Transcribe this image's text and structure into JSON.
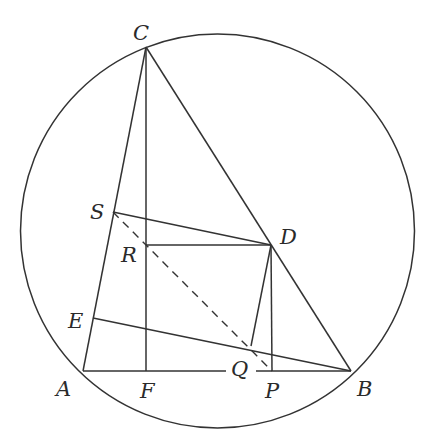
{
  "diagram": {
    "type": "geometry",
    "colors": {
      "stroke": "#333333",
      "label": "#2a2a2a",
      "background": "#ffffff"
    },
    "circle": {
      "cx": 217.5,
      "cy": 231,
      "r": 197
    },
    "points": {
      "A": {
        "label": "A",
        "x": 83,
        "y": 371
      },
      "B": {
        "label": "B",
        "x": 351,
        "y": 371
      },
      "C": {
        "label": "C",
        "x": 146,
        "y": 47
      },
      "D": {
        "label": "D",
        "x": 271,
        "y": 245
      },
      "E": {
        "label": "E",
        "x": 93,
        "y": 318
      },
      "F": {
        "label": "F",
        "x": 146,
        "y": 371
      },
      "P": {
        "label": "P",
        "x": 272,
        "y": 371
      },
      "Q": {
        "label": "Q",
        "x": 251,
        "y": 346
      },
      "R": {
        "label": "R",
        "x": 146,
        "y": 245
      },
      "S": {
        "label": "S",
        "x": 113,
        "y": 212
      }
    },
    "segments": [
      {
        "from": "A",
        "to": "B",
        "style": "solid"
      },
      {
        "from": "A",
        "to": "C",
        "style": "solid"
      },
      {
        "from": "B",
        "to": "C",
        "style": "solid"
      },
      {
        "from": "C",
        "to": "F",
        "style": "solid"
      },
      {
        "from": "S",
        "to": "D",
        "style": "solid"
      },
      {
        "from": "R",
        "to": "D",
        "style": "solid"
      },
      {
        "from": "D",
        "to": "P",
        "style": "solid"
      },
      {
        "from": "D",
        "to": "Q",
        "style": "solid"
      },
      {
        "from": "E",
        "to": "B",
        "style": "solid"
      },
      {
        "from": "S",
        "to": "P",
        "style": "dashed"
      }
    ],
    "labels": [
      {
        "text": "C",
        "x": 133,
        "y": 40
      },
      {
        "text": "S",
        "x": 90,
        "y": 219
      },
      {
        "text": "D",
        "x": 280,
        "y": 244
      },
      {
        "text": "R",
        "x": 121,
        "y": 262
      },
      {
        "text": "E",
        "x": 68,
        "y": 328
      },
      {
        "text": "Q",
        "x": 231,
        "y": 376
      },
      {
        "text": "A",
        "x": 56,
        "y": 396
      },
      {
        "text": "F",
        "x": 140,
        "y": 398
      },
      {
        "text": "P",
        "x": 265,
        "y": 398
      },
      {
        "text": "B",
        "x": 357,
        "y": 396
      }
    ]
  }
}
